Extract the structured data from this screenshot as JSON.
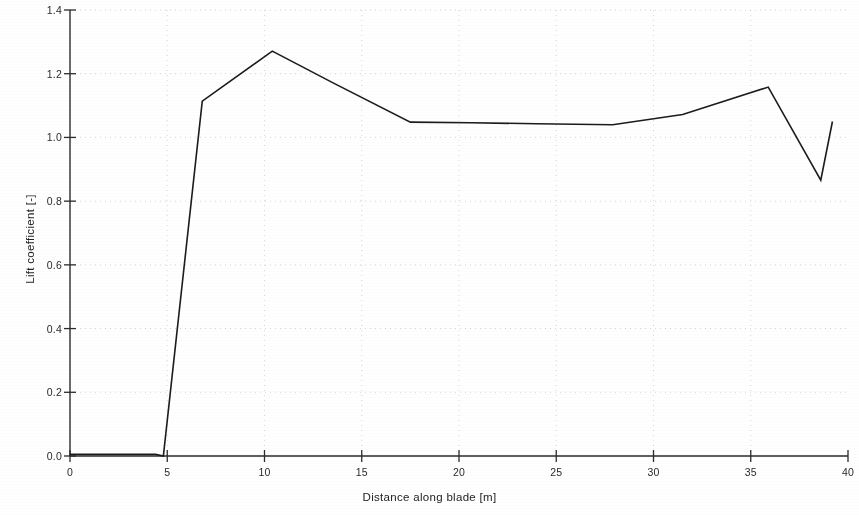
{
  "chart_data": {
    "type": "line",
    "title": "",
    "xlabel": "Distance along blade [m]",
    "ylabel": "Lift coefficient [-]",
    "xlim": [
      0,
      40
    ],
    "ylim": [
      0.0,
      1.4
    ],
    "xticks": [
      0,
      5,
      10,
      15,
      20,
      25,
      30,
      35,
      40
    ],
    "xtick_labels": [
      "0",
      "5",
      "10",
      "15",
      "20",
      "25",
      "30",
      "35",
      "40"
    ],
    "yticks": [
      0.0,
      0.2,
      0.4,
      0.6,
      0.8,
      1.0,
      1.2,
      1.4
    ],
    "ytick_labels": [
      "0.0",
      "0.2",
      "0.4",
      "0.6",
      "0.8",
      "1.0",
      "1.2",
      "1.4"
    ],
    "grid": "dotted-major-both",
    "legend": "none",
    "line_color": "#1c1c1c",
    "line_width": 1.6,
    "series": [
      {
        "name": "Lift coefficient along blade",
        "x": [
          0.0,
          1.5,
          3.0,
          4.4,
          4.8,
          6.8,
          10.4,
          13.5,
          17.5,
          20.6,
          24.0,
          27.9,
          31.5,
          35.9,
          38.6,
          39.2
        ],
        "y": [
          0.005,
          0.005,
          0.005,
          0.005,
          0.0,
          1.114,
          1.271,
          1.172,
          1.048,
          1.046,
          1.043,
          1.04,
          1.072,
          1.158,
          0.866,
          1.05
        ]
      }
    ]
  }
}
